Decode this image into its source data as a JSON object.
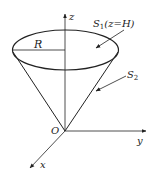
{
  "figure": {
    "type": "cone-surface-diagram",
    "labels": {
      "z_axis": "z",
      "y_axis": "y",
      "x_axis": "x",
      "origin": "O",
      "radius": "R",
      "top_surface": "S",
      "top_surface_sub": "1",
      "top_surface_cond": "(z=H)",
      "lateral_surface": "S",
      "lateral_surface_sub": "2"
    },
    "colors": {
      "stroke": "#222222",
      "background": "#ffffff"
    }
  }
}
